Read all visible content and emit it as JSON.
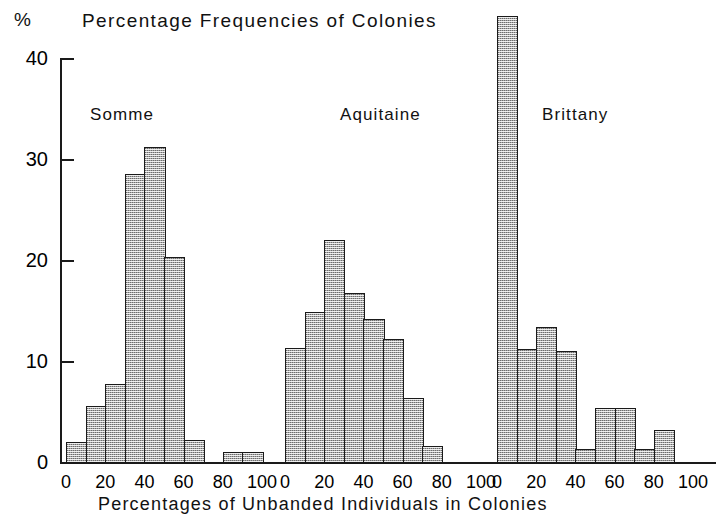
{
  "header": {
    "y_unit_symbol": "%",
    "title": "Percentage Frequencies of Colonies"
  },
  "footer": {
    "xlabel": "Percentages of Unbanded Individuals in Colonies"
  },
  "axes": {
    "y_ticks": [
      "0",
      "10",
      "20",
      "30",
      "40"
    ],
    "x_ticks": [
      "0",
      "20",
      "40",
      "60",
      "80",
      "100"
    ]
  },
  "panels": [
    {
      "name": "Somme",
      "label": "Somme"
    },
    {
      "name": "Aquitaine",
      "label": "Aquitaine"
    },
    {
      "name": "Brittany",
      "label": "Brittany"
    }
  ],
  "colors": {
    "ink": "#1a1a1a",
    "bar_fill": "#a8a8a8",
    "background": "#ffffff"
  },
  "chart_data": {
    "type": "bar",
    "title": "Percentage Frequencies of Colonies",
    "xlabel": "Percentages of Unbanded Individuals in Colonies",
    "ylabel": "%",
    "ylim": [
      0,
      40
    ],
    "xlim": [
      0,
      100
    ],
    "grid": false,
    "legend": "none",
    "bin_width": 10,
    "bin_starts": [
      0,
      10,
      20,
      30,
      40,
      50,
      60,
      70,
      80,
      90
    ],
    "series": [
      {
        "name": "Somme",
        "values": [
          2.0,
          5.5,
          7.7,
          28.5,
          31.2,
          20.3,
          2.2,
          0.0,
          1.0,
          1.0
        ]
      },
      {
        "name": "Aquitaine",
        "values": [
          11.3,
          14.9,
          22.0,
          16.7,
          14.2,
          12.2,
          6.3,
          1.6,
          0.0,
          0.0
        ]
      },
      {
        "name": "Brittany",
        "values": [
          44.2,
          11.2,
          13.4,
          11.0,
          1.3,
          5.3,
          5.3,
          1.3,
          3.2,
          0.0
        ]
      }
    ]
  }
}
